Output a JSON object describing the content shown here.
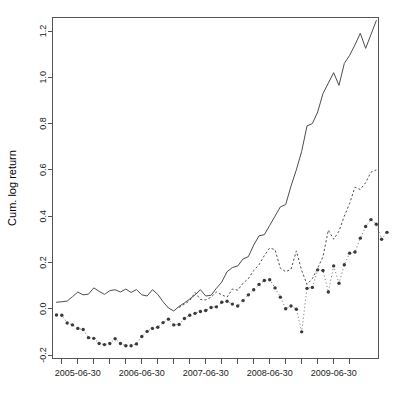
{
  "chart_data": {
    "type": "line",
    "title": "",
    "xlabel": "",
    "ylabel": "Cum. log return",
    "xlim": [
      "2005-03-31",
      "2010-03-31"
    ],
    "ylim": [
      -0.23,
      1.27
    ],
    "grid": false,
    "legend": "none",
    "x_tick_labels": [
      "2005-06-30",
      "2006-06-30",
      "2007-06-30",
      "2008-06-30",
      "2009-06-30"
    ],
    "x_major_tick_values": [
      "2005-06-30",
      "2006-06-30",
      "2007-06-30",
      "2008-06-30",
      "2009-06-30"
    ],
    "x_minor_tick_count_between_majors": 3,
    "y_tick_labels": [
      "-0.2",
      "0.0",
      "0.2",
      "0.4",
      "0.6",
      "0.8",
      "1.0",
      "1.2"
    ],
    "y_tick_values": [
      -0.2,
      0.0,
      0.2,
      0.4,
      0.6,
      0.8,
      1.0,
      1.2
    ],
    "x_index_range": [
      0,
      60
    ],
    "series": [
      {
        "name": "solid-line",
        "style": "solid",
        "marker": "none",
        "color": "#4d4d4d",
        "values": [
          0.028,
          0.03,
          0.033,
          0.052,
          0.072,
          0.06,
          0.063,
          0.09,
          0.075,
          0.062,
          0.078,
          0.082,
          0.072,
          0.085,
          0.07,
          0.083,
          0.06,
          0.055,
          0.082,
          0.062,
          0.03,
          0.003,
          -0.01,
          0.01,
          0.025,
          0.042,
          0.06,
          0.082,
          0.055,
          0.058,
          0.088,
          0.115,
          0.16,
          0.178,
          0.185,
          0.215,
          0.225,
          0.275,
          0.315,
          0.32,
          0.36,
          0.4,
          0.44,
          0.45,
          0.53,
          0.6,
          0.68,
          0.79,
          0.8,
          0.85,
          0.93,
          0.975,
          1.02,
          0.965,
          1.06,
          1.095,
          1.14,
          1.19,
          1.125,
          1.185,
          1.245
        ]
      },
      {
        "name": "dashed-line",
        "style": "dashed",
        "marker": "none",
        "color": "#4d4d4d",
        "values": [
          null,
          null,
          null,
          null,
          null,
          null,
          null,
          null,
          null,
          null,
          null,
          null,
          null,
          null,
          null,
          null,
          null,
          null,
          null,
          null,
          null,
          null,
          null,
          0.005,
          0.02,
          0.035,
          0.07,
          0.04,
          0.038,
          0.05,
          0.072,
          0.06,
          0.05,
          0.085,
          0.08,
          0.11,
          0.13,
          0.165,
          0.19,
          0.23,
          0.262,
          0.255,
          0.175,
          0.16,
          0.17,
          0.25,
          0.165,
          0.105,
          0.13,
          0.175,
          0.225,
          0.34,
          0.3,
          0.335,
          0.4,
          0.455,
          0.525,
          0.515,
          0.545,
          0.59,
          0.6
        ]
      },
      {
        "name": "dotted-points",
        "style": "dotted",
        "marker": "point",
        "color": "#3a3a3a",
        "values": [
          -0.027,
          -0.028,
          -0.062,
          -0.07,
          -0.085,
          -0.09,
          -0.125,
          -0.128,
          -0.15,
          -0.155,
          -0.15,
          -0.13,
          -0.15,
          -0.16,
          -0.16,
          -0.152,
          -0.12,
          -0.098,
          -0.085,
          -0.08,
          -0.06,
          -0.045,
          -0.07,
          -0.068,
          -0.042,
          -0.028,
          -0.02,
          -0.012,
          -0.008,
          0.005,
          0.008,
          0.028,
          0.032,
          0.02,
          0.012,
          0.035,
          0.06,
          0.082,
          0.105,
          0.122,
          0.125,
          0.09,
          0.05,
          0.0,
          0.012,
          -0.002,
          -0.1,
          0.088,
          0.092,
          0.168,
          0.165,
          0.072,
          0.185,
          0.11,
          0.19,
          0.24,
          0.245,
          0.305,
          0.355,
          0.385,
          0.365,
          0.3,
          0.33
        ]
      }
    ]
  },
  "axes": {
    "y_label_text": "Cum. log return"
  }
}
